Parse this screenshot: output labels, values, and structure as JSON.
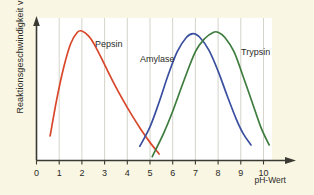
{
  "figure": {
    "background_color": "#f9f6e3",
    "plot_background_color": "#ffffff",
    "axis_color": "#3a3a33",
    "grid_color": "#cfcfc4"
  },
  "axes": {
    "y_axis_label": "Reaktionsgeschwindigkeit v",
    "x_axis_label": "pH-Wert",
    "x_tick_labels": [
      "0",
      "1",
      "2",
      "3",
      "4",
      "5",
      "6",
      "7",
      "8",
      "9",
      "10"
    ]
  },
  "series_labels": {
    "pepsin": "Pepsin",
    "amylase": "Amylase",
    "trypsin": "Trypsin"
  },
  "chart_data": {
    "type": "line",
    "title": "",
    "xlabel": "pH-Wert",
    "ylabel": "Reaktionsgeschwindigkeit v",
    "xlim": [
      0,
      10.8
    ],
    "ylim": [
      0,
      1.08
    ],
    "grid": "vertical-only",
    "legend": "inline-curve-labels",
    "x_ticks": [
      0,
      1,
      2,
      3,
      4,
      5,
      6,
      7,
      8,
      9,
      10
    ],
    "y_ticks": [],
    "series": [
      {
        "name": "Pepsin",
        "color": "#d9472a",
        "peak_ph": 2.0,
        "peak_value": 1.0,
        "x": [
          0.6,
          0.9,
          1.2,
          1.5,
          1.8,
          2.0,
          2.3,
          2.6,
          3.0,
          3.4,
          3.8,
          4.2,
          4.6,
          5.0,
          5.4
        ],
        "y": [
          0.19,
          0.48,
          0.72,
          0.9,
          0.99,
          1.0,
          0.96,
          0.88,
          0.74,
          0.6,
          0.47,
          0.35,
          0.24,
          0.14,
          0.05
        ]
      },
      {
        "name": "Amylase",
        "color": "#3b4fa0",
        "peak_ph": 6.9,
        "peak_value": 0.98,
        "x": [
          4.55,
          5.0,
          5.4,
          5.8,
          6.2,
          6.6,
          6.9,
          7.2,
          7.6,
          8.0,
          8.4,
          8.8,
          9.1,
          9.45
        ],
        "y": [
          0.11,
          0.26,
          0.45,
          0.66,
          0.84,
          0.95,
          0.98,
          0.95,
          0.85,
          0.69,
          0.5,
          0.32,
          0.21,
          0.12
        ]
      },
      {
        "name": "Trypsin",
        "color": "#3f7d3f",
        "peak_ph": 8.0,
        "peak_value": 0.99,
        "x": [
          5.1,
          5.6,
          6.0,
          6.5,
          7.0,
          7.4,
          7.8,
          8.0,
          8.3,
          8.7,
          9.1,
          9.5,
          9.9,
          10.25
        ],
        "y": [
          0.03,
          0.21,
          0.38,
          0.62,
          0.84,
          0.94,
          0.99,
          0.99,
          0.95,
          0.84,
          0.65,
          0.45,
          0.25,
          0.12
        ]
      }
    ]
  }
}
